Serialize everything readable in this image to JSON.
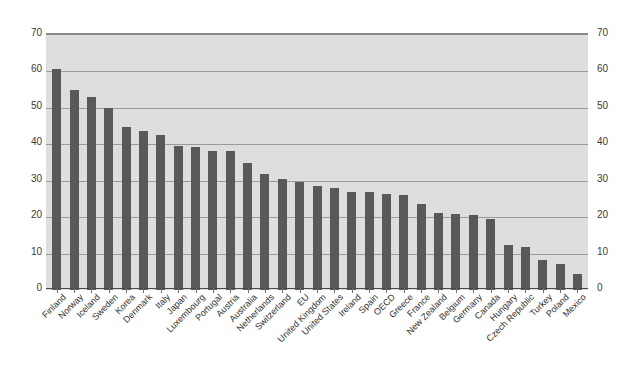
{
  "chart_data": {
    "type": "bar",
    "title": "",
    "subtitle": "",
    "xlabel": "",
    "ylabel": "",
    "ylim": [
      0,
      70
    ],
    "ytick_step": 10,
    "yticks": [
      0,
      10,
      20,
      30,
      40,
      50,
      60,
      70
    ],
    "ytick_labels_left": [
      "0",
      "10",
      "20",
      "30",
      "40",
      "50",
      "60",
      "70"
    ],
    "ytick_labels_right": [
      "0",
      "10",
      "20",
      "30",
      "40",
      "50",
      "60",
      "70"
    ],
    "grid": true,
    "grid_axis": "y",
    "legend": false,
    "legend_position": "none",
    "bar_color": "#595959",
    "plot_background": "#dedede",
    "gridline_color": "#9a9a9a",
    "axis_color": "#4a4a4a",
    "page_background": "#ffffff",
    "label_rotation_degrees": -45,
    "categories": [
      "Finland",
      "Norway",
      "Iceland",
      "Sweden",
      "Korea",
      "Denmark",
      "Italy",
      "Japan",
      "Luxembourg",
      "Portugal",
      "Austria",
      "Australia",
      "Netherlands",
      "Switzerland",
      "EU",
      "United Kingdom",
      "United States",
      "Ireland",
      "Spain",
      "OECD",
      "Greece",
      "France",
      "New Zealand",
      "Belgium",
      "Germany",
      "Canada",
      "Hungary",
      "Czech Republic",
      "Turkey",
      "Poland",
      "Mexico"
    ],
    "values": [
      60.7,
      54.8,
      53.0,
      50.0,
      44.7,
      43.6,
      42.6,
      39.5,
      39.2,
      38.2,
      38.2,
      35.0,
      31.8,
      30.6,
      29.7,
      28.6,
      28.0,
      26.9,
      26.8,
      26.3,
      26.2,
      23.7,
      21.2,
      20.9,
      20.6,
      19.4,
      12.3,
      11.9,
      8.3,
      7.2,
      4.5
    ]
  }
}
